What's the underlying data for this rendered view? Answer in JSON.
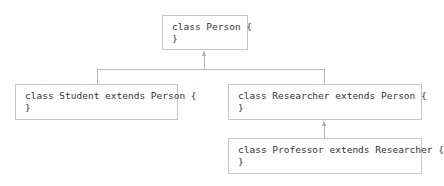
{
  "diagram": {
    "type": "class-inheritance",
    "nodes": [
      {
        "id": "person",
        "line1": "class Person {",
        "line2": "}"
      },
      {
        "id": "student",
        "line1": "class Student extends Person {",
        "line2": "}"
      },
      {
        "id": "researcher",
        "line1": "class Researcher extends Person {",
        "line2": "}"
      },
      {
        "id": "professor",
        "line1": "class Professor extends Researcher {",
        "line2": "}"
      }
    ],
    "edges": [
      {
        "from": "student",
        "to": "person",
        "kind": "extends"
      },
      {
        "from": "researcher",
        "to": "person",
        "kind": "extends"
      },
      {
        "from": "professor",
        "to": "researcher",
        "kind": "extends"
      }
    ],
    "colors": {
      "border": "#c8c8c8",
      "connector": "#b8b8b8",
      "text": "#333333"
    }
  }
}
